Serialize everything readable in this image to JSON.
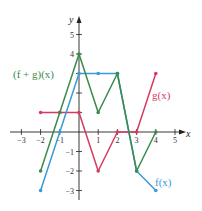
{
  "chart_data": {
    "type": "line",
    "title": "",
    "xlabel": "x",
    "ylabel": "y",
    "xlim": [
      -3.5,
      5.5
    ],
    "ylim": [
      -3.5,
      5.5
    ],
    "x_ticks": [
      -3,
      -2,
      -1,
      1,
      2,
      3,
      4,
      5
    ],
    "y_ticks": [
      -3,
      -2,
      -1,
      1,
      2,
      3,
      4,
      5
    ],
    "grid": false,
    "series": [
      {
        "name": "f(x)",
        "color": "#3a9ad4",
        "points": [
          [
            -2,
            -3
          ],
          [
            -1,
            0
          ],
          [
            0,
            3
          ],
          [
            1,
            3
          ],
          [
            2,
            3
          ],
          [
            3,
            -2
          ],
          [
            4,
            -3
          ]
        ]
      },
      {
        "name": "g(x)",
        "color": "#d63a62",
        "points": [
          [
            -2,
            1
          ],
          [
            -1,
            1
          ],
          [
            0,
            1
          ],
          [
            1,
            -2
          ],
          [
            2,
            0
          ],
          [
            3,
            0
          ],
          [
            4,
            3
          ]
        ]
      },
      {
        "name": "(f + g)(x)",
        "color": "#3a8a4a",
        "points": [
          [
            -2,
            -2
          ],
          [
            -1,
            1
          ],
          [
            0,
            4
          ],
          [
            1,
            1
          ],
          [
            2,
            3
          ],
          [
            3,
            -2
          ],
          [
            4,
            0
          ]
        ]
      }
    ]
  },
  "labels": {
    "x_axis": "x",
    "y_axis": "y",
    "f": "f(x)",
    "g": "g(x)",
    "fg": "(f + g)(x)",
    "x_tick_text": [
      "−3",
      "−2",
      "−1",
      "1",
      "2",
      "3",
      "4",
      "5"
    ],
    "y_tick_text": [
      "5",
      "4",
      "−1",
      "−2",
      "−3"
    ]
  }
}
